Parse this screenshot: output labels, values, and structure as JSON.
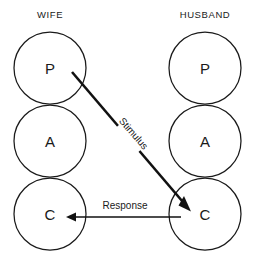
{
  "diagram": {
    "title_left": "WIFE",
    "title_right": "HUSBAND",
    "columns": [
      {
        "id": "wife",
        "header": "WIFE",
        "header_x": 50,
        "header_y": 14,
        "center_x": 50,
        "ego_states": [
          {
            "letter": "P",
            "name": "parent",
            "cx": 50,
            "cy": 68,
            "r": 36
          },
          {
            "letter": "A",
            "name": "adult",
            "cx": 50,
            "cy": 141,
            "r": 36
          },
          {
            "letter": "C",
            "name": "child",
            "cx": 50,
            "cy": 214,
            "r": 36
          }
        ]
      },
      {
        "id": "husband",
        "header": "HUSBAND",
        "header_x": 205,
        "header_y": 14,
        "center_x": 205,
        "ego_states": [
          {
            "letter": "P",
            "name": "parent",
            "cx": 205,
            "cy": 68,
            "r": 36
          },
          {
            "letter": "A",
            "name": "adult",
            "cx": 205,
            "cy": 141,
            "r": 36
          },
          {
            "letter": "C",
            "name": "child",
            "cx": 205,
            "cy": 214,
            "r": 36
          }
        ]
      }
    ],
    "transactions": [
      {
        "id": "stimulus",
        "label": "Stimulus",
        "from": "wife-parent",
        "to": "husband-child",
        "x1": 72,
        "y1": 72,
        "x2": 190,
        "y2": 210,
        "label_x": 133,
        "label_y": 134,
        "label_rotate": 49,
        "stroke": "#111111",
        "stroke_width": 2.6
      },
      {
        "id": "response",
        "label": "Response",
        "from": "husband-child",
        "to": "wife-child",
        "x1": 181,
        "y1": 217,
        "x2": 66,
        "y2": 217,
        "label_x": 125,
        "label_y": 206,
        "label_rotate": 0,
        "stroke": "#111111",
        "stroke_width": 1.7
      }
    ],
    "colors": {
      "background": "#ffffff",
      "stroke": "#1a1a1a",
      "arrow": "#111111",
      "text": "#1a1a1a"
    }
  }
}
